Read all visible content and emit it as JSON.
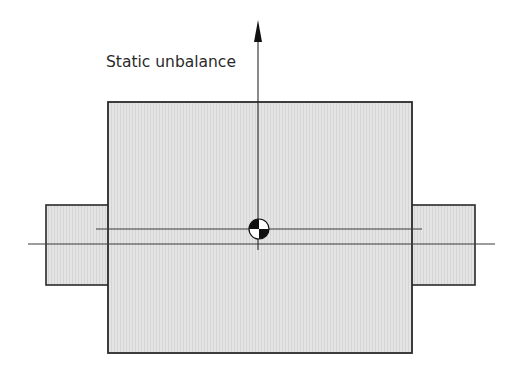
{
  "diagram": {
    "title": "Static unbalance",
    "label": "Static unbalance",
    "colors": {
      "fill": "#e2e2e2",
      "stroke": "#2a2a2a",
      "line": "#3a3a3a",
      "background": "#ffffff"
    },
    "components": {
      "rotor": {
        "x": 108,
        "y": 102,
        "width": 304,
        "height": 251
      },
      "left_shaft": {
        "x": 46,
        "y": 205,
        "width": 63,
        "height": 80
      },
      "right_shaft": {
        "x": 411,
        "y": 205,
        "width": 64,
        "height": 80
      },
      "axis_line": {
        "x1": 28,
        "x2": 495,
        "y": 244
      },
      "mass_axis_line": {
        "x1": 96,
        "x2": 422,
        "y": 229
      },
      "force_arrow": {
        "x": 258,
        "y_tip": 20,
        "y_base": 250
      },
      "center_of_mass_symbol": {
        "cx": 259,
        "cy": 229,
        "r": 10
      }
    }
  }
}
